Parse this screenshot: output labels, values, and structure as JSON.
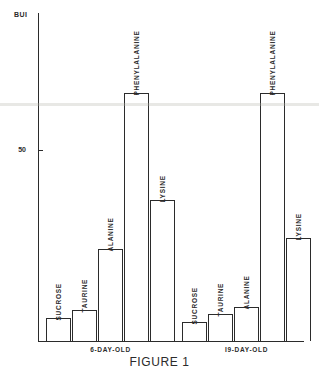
{
  "figure": {
    "caption": "FIGURE 1"
  },
  "chart_data": {
    "type": "bar",
    "title": "",
    "ylabel": "BUI",
    "xlabel": "",
    "ylim": [
      0,
      86
    ],
    "grid": false,
    "legend": "none",
    "y_ticks": [
      {
        "value": 50,
        "label": "50"
      }
    ],
    "categories": [
      "SUCROSE",
      "TAURINE",
      "ALANINE",
      "PHENYLALANINE",
      "LYSINE"
    ],
    "groups": [
      {
        "name": "6-DAY-OLD",
        "label": "6-DAY-OLD",
        "bars": [
          {
            "category": "SUCROSE",
            "label": "SUCROSE",
            "value": 6
          },
          {
            "category": "TAURINE",
            "label": "TAURINE",
            "value": 8
          },
          {
            "category": "ALANINE",
            "label": "ALANINE",
            "value": 24
          },
          {
            "category": "PHENYLALANINE",
            "label": "PHENYLALANINE",
            "value": 65
          },
          {
            "category": "LYSINE",
            "label": "LYSINE",
            "value": 37
          }
        ]
      },
      {
        "name": "19-DAY-OLD",
        "label": "I9-DAY-OLD",
        "bars": [
          {
            "category": "SUCROSE",
            "label": "SUCROSE",
            "value": 5
          },
          {
            "category": "TAURINE",
            "label": "TAURINE",
            "value": 7
          },
          {
            "category": "ALANINE",
            "label": "ALANINE",
            "value": 9
          },
          {
            "category": "PHENYLALANINE",
            "label": "PHENYLALANINE",
            "value": 65
          },
          {
            "category": "LYSINE",
            "label": "LYSINE",
            "value": 27
          }
        ]
      }
    ],
    "colors": {
      "axis": "#2b2b2b",
      "bar_stroke": "#2b2b2b",
      "bar_fill": "#ffffff",
      "text": "#2b2b2b",
      "background": "#ffffff"
    }
  }
}
